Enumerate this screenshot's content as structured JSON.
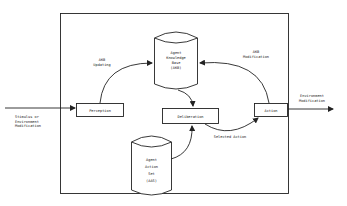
{
  "diagram": {
    "type": "agent-architecture-flow",
    "nodes": {
      "knowledge_base": {
        "lines": [
          "Agent",
          "Knowledge",
          "Base",
          "(AKB)"
        ],
        "shape": "cylinder"
      },
      "action_set": {
        "lines": [
          "Agent",
          "Action",
          "Set",
          "(AAS)"
        ],
        "shape": "cylinder"
      },
      "perception": {
        "label": "Perception",
        "shape": "rectangle"
      },
      "deliberation": {
        "label": "Deliberation",
        "shape": "rectangle"
      },
      "action": {
        "label": "Action",
        "shape": "rectangle"
      }
    },
    "edges": {
      "akb_updating": {
        "lines": [
          "AKB",
          "Updating"
        ]
      },
      "akb_modification": {
        "lines": [
          "AKB",
          "Modification"
        ]
      },
      "selected_action": {
        "label": "Selected Action"
      },
      "stimulus": {
        "lines": [
          "Stimulus or",
          "Environment",
          "Modification"
        ]
      },
      "environment_modification": {
        "lines": [
          "Environment",
          "Modification"
        ]
      }
    },
    "colors": {
      "stroke": "#222222",
      "background": "#ffffff"
    }
  }
}
